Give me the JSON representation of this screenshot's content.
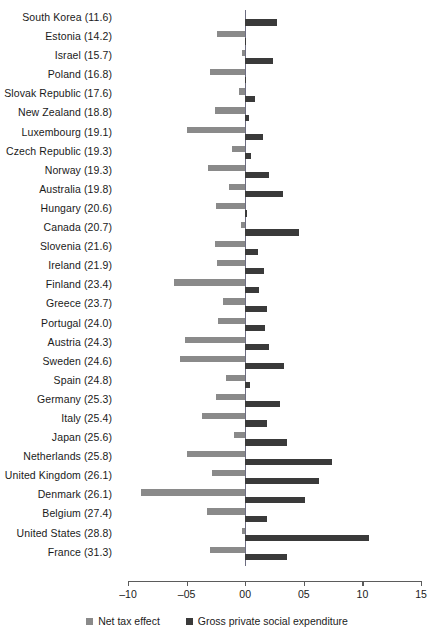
{
  "chart_data": {
    "type": "bar",
    "orientation": "horizontal",
    "title": "",
    "xlabel": "",
    "ylabel": "",
    "xlim": [
      -10,
      15
    ],
    "xticks": [
      -10,
      -5,
      0,
      5,
      10,
      15
    ],
    "xtick_labels": [
      "–10",
      "–05",
      "00",
      "05",
      "10",
      "15"
    ],
    "grid": false,
    "legend_position": "bottom",
    "zero_reference_line": true,
    "categories": [
      "South Korea (11.6)",
      "Estonia (14.2)",
      "Israel (15.7)",
      "Poland (16.8)",
      "Slovak Republic (17.6)",
      "New Zealand (18.8)",
      "Luxembourg (19.1)",
      "Czech Republic (19.3)",
      "Norway (19.3)",
      "Australia (19.8)",
      "Hungary (20.6)",
      "Canada (20.7)",
      "Slovenia (21.6)",
      "Ireland (21.9)",
      "Finland (23.4)",
      "Greece (23.7)",
      "Portugal (24.0)",
      "Austria (24.3)",
      "Sweden (24.6)",
      "Spain (24.8)",
      "Germany (25.3)",
      "Italy (25.4)",
      "Japan (25.6)",
      "Netherlands (25.8)",
      "United Kingdom (26.1)",
      "Denmark (26.1)",
      "Belgium (27.4)",
      "United States (28.8)",
      "France (31.3)"
    ],
    "series": [
      {
        "name": "Net tax effect",
        "color": "#8a8a8a",
        "values": [
          0.0,
          -2.4,
          -0.3,
          -3.0,
          -0.5,
          -2.6,
          -5.0,
          -1.1,
          -3.2,
          -1.4,
          -2.5,
          -0.4,
          -2.6,
          -2.4,
          -6.1,
          -1.9,
          -2.3,
          -5.1,
          -5.6,
          -1.6,
          -2.5,
          -3.7,
          -1.0,
          -5.0,
          -2.8,
          -8.9,
          -3.3,
          -0.3,
          -3.0
        ]
      },
      {
        "name": "Gross private social expenditure",
        "color": "#3a3a3a",
        "values": [
          2.7,
          0.1,
          2.4,
          0.1,
          0.8,
          0.3,
          1.5,
          0.5,
          2.0,
          3.2,
          0.2,
          4.6,
          1.1,
          1.6,
          1.2,
          1.9,
          1.7,
          2.0,
          3.3,
          0.4,
          3.0,
          1.9,
          3.6,
          7.4,
          6.3,
          5.1,
          1.9,
          10.6,
          3.6
        ]
      }
    ]
  },
  "legend": {
    "items": [
      {
        "label": "Net tax effect",
        "swatch": "net"
      },
      {
        "label": "Gross private social expenditure",
        "swatch": "gross"
      }
    ]
  },
  "axis": {
    "tick_labels": [
      "–10",
      "–05",
      "00",
      "05",
      "10",
      "15"
    ]
  }
}
